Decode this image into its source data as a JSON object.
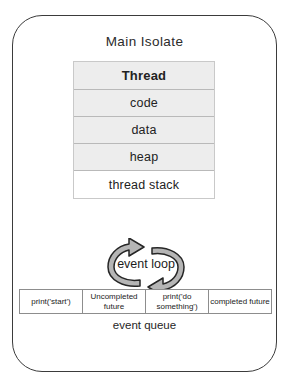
{
  "diagram": {
    "title": "Main Isolate",
    "memory_stack": [
      {
        "label": "Thread",
        "style": "header"
      },
      {
        "label": "code",
        "style": "filled"
      },
      {
        "label": "data",
        "style": "filled"
      },
      {
        "label": "heap",
        "style": "filled"
      },
      {
        "label": "thread stack",
        "style": "plain"
      }
    ],
    "event_loop": {
      "label": "event loop",
      "icon": "circular-arrows-icon"
    },
    "event_queue": {
      "label": "event queue",
      "cells": [
        "print('start')",
        "Uncompleted future",
        "print('do something')",
        "completed future"
      ]
    },
    "colors": {
      "outline": "#3b3b3b",
      "cell_fill": "#ededed",
      "cell_border": "#b9b9b9",
      "queue_border": "#8d8d8d",
      "arrow_fill": "#b5b5b5",
      "text": "#1a1a1a"
    }
  }
}
